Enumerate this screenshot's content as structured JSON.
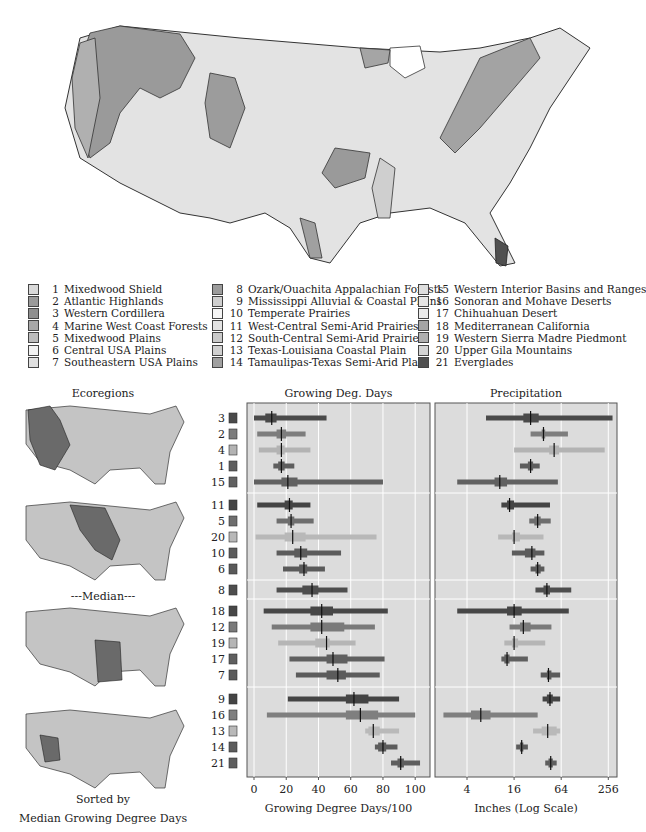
{
  "legend": {
    "columns": [
      [
        {
          "id": 1,
          "name": "Mixedwood Shield",
          "color": "#d9d9d9"
        },
        {
          "id": 2,
          "name": "Atlantic Highlands",
          "color": "#9a9a9a"
        },
        {
          "id": 3,
          "name": "Western Cordillera",
          "color": "#8f8f8f"
        },
        {
          "id": 4,
          "name": "Marine West Coast Forests",
          "color": "#a8a8a8"
        },
        {
          "id": 5,
          "name": "Mixedwood Plains",
          "color": "#bdbdbd"
        },
        {
          "id": 6,
          "name": "Central USA Plains",
          "color": "#f2f2f2"
        },
        {
          "id": 7,
          "name": "Southeastern USA Plains",
          "color": "#e0e0e0"
        }
      ],
      [
        {
          "id": 8,
          "name": "Ozark/Ouachita Appalachian Forests",
          "color": "#9c9c9c"
        },
        {
          "id": 9,
          "name": "Mississippi Alluvial & Coastal Plains",
          "color": "#cfcfcf"
        },
        {
          "id": 10,
          "name": "Temperate Prairies",
          "color": "#f5f5f5"
        },
        {
          "id": 11,
          "name": "West-Central Semi-Arid Prairies",
          "color": "#e3e3e3"
        },
        {
          "id": 12,
          "name": "South-Central Semi-Arid Prairies",
          "color": "#cacaca"
        },
        {
          "id": 13,
          "name": "Texas-Louisiana Coastal Plain",
          "color": "#d0d0d0"
        },
        {
          "id": 14,
          "name": "Tamaulipas-Texas Semi-Arid Plain",
          "color": "#a0a0a0"
        }
      ],
      [
        {
          "id": 15,
          "name": "Western Interior Basins and Ranges",
          "color": "#dedede"
        },
        {
          "id": 16,
          "name": "Sonoran and Mohave Deserts",
          "color": "#e6e6e6"
        },
        {
          "id": 17,
          "name": "Chihuahuan Desert",
          "color": "#ececec"
        },
        {
          "id": 18,
          "name": "Mediterranean California",
          "color": "#a5a5a5"
        },
        {
          "id": 19,
          "name": "Western Sierra Madre Piedmont",
          "color": "#b0b0b0"
        },
        {
          "id": 20,
          "name": "Upper Gila Mountains",
          "color": "#d4d4d4"
        },
        {
          "id": 21,
          "name": "Everglades",
          "color": "#505050"
        }
      ]
    ]
  },
  "small_maps": {
    "title": "Ecoregions",
    "median_label": "---Median---",
    "footer_line1": "Sorted by",
    "footer_line2": "Median Growing Degree Days"
  },
  "chart_data": [
    {
      "type": "boxplot-horizontal",
      "title": "Growing Deg. Days",
      "xlabel": "Growing Degree Days/100",
      "xlim": [
        -2,
        108
      ],
      "xticks": [
        0,
        20,
        40,
        60,
        80,
        100
      ],
      "scale": "linear",
      "grid": true,
      "groups": [
        {
          "rows": [
            {
              "id": 3,
              "color": "#4a4a4a",
              "min": 0,
              "q1": 7,
              "median": 11,
              "q3": 14,
              "max": 45
            },
            {
              "id": 2,
              "color": "#7d7d7d",
              "min": 2,
              "q1": 14,
              "median": 17,
              "q3": 20,
              "max": 32
            },
            {
              "id": 4,
              "color": "#b3b3b3",
              "min": 3,
              "q1": 14,
              "median": 17,
              "q3": 19,
              "max": 35
            },
            {
              "id": 1,
              "color": "#5e5e5e",
              "min": 12,
              "q1": 15,
              "median": 17,
              "q3": 19,
              "max": 25
            },
            {
              "id": 15,
              "color": "#616161",
              "min": 0,
              "q1": 17,
              "median": 21,
              "q3": 27,
              "max": 80
            }
          ]
        },
        {
          "rows": [
            {
              "id": 11,
              "color": "#444444",
              "min": 2,
              "q1": 19,
              "median": 22,
              "q3": 24,
              "max": 35
            },
            {
              "id": 5,
              "color": "#6e6e6e",
              "min": 14,
              "q1": 21,
              "median": 23,
              "q3": 25,
              "max": 37
            },
            {
              "id": 20,
              "color": "#b8b8b8",
              "min": 1,
              "q1": 19,
              "median": 24,
              "q3": 32,
              "max": 76
            },
            {
              "id": 10,
              "color": "#5c5c5c",
              "min": 14,
              "q1": 25,
              "median": 29,
              "q3": 33,
              "max": 54
            },
            {
              "id": 6,
              "color": "#5a5a5a",
              "min": 18,
              "q1": 28,
              "median": 31,
              "q3": 33,
              "max": 44
            }
          ]
        },
        {
          "rows": [
            {
              "id": 8,
              "color": "#4e4e4e",
              "min": 14,
              "q1": 30,
              "median": 36,
              "q3": 40,
              "max": 58
            }
          ]
        },
        {
          "rows": [
            {
              "id": 18,
              "color": "#474747",
              "min": 6,
              "q1": 35,
              "median": 42,
              "q3": 49,
              "max": 83
            },
            {
              "id": 12,
              "color": "#7a7a7a",
              "min": 11,
              "q1": 35,
              "median": 42,
              "q3": 56,
              "max": 75
            },
            {
              "id": 19,
              "color": "#b5b5b5",
              "min": 15,
              "q1": 38,
              "median": 45,
              "q3": 47,
              "max": 63
            },
            {
              "id": 17,
              "color": "#5f5f5f",
              "min": 22,
              "q1": 45,
              "median": 49,
              "q3": 58,
              "max": 81
            },
            {
              "id": 7,
              "color": "#5b5b5b",
              "min": 26,
              "q1": 45,
              "median": 52,
              "q3": 57,
              "max": 78
            }
          ]
        },
        {
          "rows": [
            {
              "id": 9,
              "color": "#444444",
              "min": 21,
              "q1": 57,
              "median": 62,
              "q3": 71,
              "max": 90
            },
            {
              "id": 16,
              "color": "#7f7f7f",
              "min": 8,
              "q1": 57,
              "median": 66,
              "q3": 77,
              "max": 100
            },
            {
              "id": 13,
              "color": "#b9b9b9",
              "min": 69,
              "q1": 71,
              "median": 74,
              "q3": 78,
              "max": 90
            },
            {
              "id": 14,
              "color": "#5c5c5c",
              "min": 75,
              "q1": 77,
              "median": 80,
              "q3": 82,
              "max": 89
            },
            {
              "id": 21,
              "color": "#5e5e5e",
              "min": 85,
              "q1": 89,
              "median": 91,
              "q3": 93,
              "max": 103
            }
          ]
        }
      ]
    },
    {
      "type": "boxplot-horizontal",
      "title": "Precipitation",
      "xlabel": "Inches (Log Scale)",
      "xlim": [
        1.6,
        340
      ],
      "xticks": [
        4,
        16,
        64,
        256
      ],
      "scale": "log",
      "grid": true,
      "groups": [
        {
          "rows": [
            {
              "id": 3,
              "color": "#4a4a4a",
              "min": 7,
              "q1": 21,
              "median": 26,
              "q3": 33,
              "max": 290
            },
            {
              "id": 2,
              "color": "#7d7d7d",
              "min": 26,
              "q1": 36,
              "median": 38,
              "q3": 40,
              "max": 78
            },
            {
              "id": 4,
              "color": "#b3b3b3",
              "min": 16,
              "q1": 45,
              "median": 52,
              "q3": 60,
              "max": 230
            },
            {
              "id": 1,
              "color": "#5e5e5e",
              "min": 19,
              "q1": 24,
              "median": 26,
              "q3": 28,
              "max": 34
            },
            {
              "id": 15,
              "color": "#616161",
              "min": 3,
              "q1": 9,
              "median": 10.5,
              "q3": 13,
              "max": 58
            }
          ]
        },
        {
          "rows": [
            {
              "id": 11,
              "color": "#444444",
              "min": 11,
              "q1": 13,
              "median": 14,
              "q3": 16,
              "max": 46
            },
            {
              "id": 5,
              "color": "#6e6e6e",
              "min": 25,
              "q1": 29,
              "median": 32,
              "q3": 35,
              "max": 47
            },
            {
              "id": 20,
              "color": "#b8b8b8",
              "min": 10,
              "q1": 15,
              "median": 16,
              "q3": 19,
              "max": 38
            },
            {
              "id": 10,
              "color": "#5c5c5c",
              "min": 15,
              "q1": 22,
              "median": 27,
              "q3": 30,
              "max": 39
            },
            {
              "id": 6,
              "color": "#5a5a5a",
              "min": 26,
              "q1": 30,
              "median": 32,
              "q3": 35,
              "max": 39
            }
          ]
        },
        {
          "rows": [
            {
              "id": 8,
              "color": "#4e4e4e",
              "min": 30,
              "q1": 38,
              "median": 42,
              "q3": 46,
              "max": 86
            }
          ]
        },
        {
          "rows": [
            {
              "id": 18,
              "color": "#474747",
              "min": 3,
              "q1": 13,
              "median": 16,
              "q3": 20,
              "max": 80
            },
            {
              "id": 12,
              "color": "#7a7a7a",
              "min": 14,
              "q1": 19,
              "median": 21,
              "q3": 26,
              "max": 48
            },
            {
              "id": 19,
              "color": "#b5b5b5",
              "min": 12,
              "q1": 15,
              "median": 16,
              "q3": 18,
              "max": 40
            },
            {
              "id": 17,
              "color": "#5f5f5f",
              "min": 11,
              "q1": 12,
              "median": 13,
              "q3": 14,
              "max": 24
            },
            {
              "id": 7,
              "color": "#5b5b5b",
              "min": 35,
              "q1": 42,
              "median": 44,
              "q3": 48,
              "max": 62
            }
          ]
        },
        {
          "rows": [
            {
              "id": 9,
              "color": "#444444",
              "min": 37,
              "q1": 42,
              "median": 46,
              "q3": 50,
              "max": 62
            },
            {
              "id": 16,
              "color": "#7f7f7f",
              "min": 2,
              "q1": 4.5,
              "median": 6,
              "q3": 8,
              "max": 32
            },
            {
              "id": 13,
              "color": "#b9b9b9",
              "min": 28,
              "q1": 36,
              "median": 43,
              "q3": 56,
              "max": 62
            },
            {
              "id": 14,
              "color": "#5c5c5c",
              "min": 17,
              "q1": 19,
              "median": 20,
              "q3": 21,
              "max": 24
            },
            {
              "id": 21,
              "color": "#5e5e5e",
              "min": 40,
              "q1": 44,
              "median": 47,
              "q3": 50,
              "max": 56
            }
          ]
        }
      ]
    }
  ]
}
